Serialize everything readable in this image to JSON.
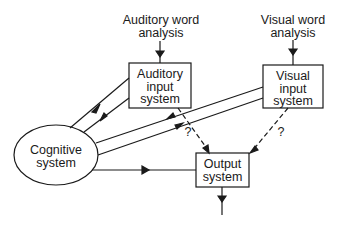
{
  "diagram": {
    "sources": {
      "auditory": {
        "line1": "Auditory word",
        "line2": "analysis"
      },
      "visual": {
        "line1": "Visual word",
        "line2": "analysis"
      }
    },
    "nodes": {
      "auditory_input": {
        "line1": "Auditory",
        "line2": "input",
        "line3": "system"
      },
      "visual_input": {
        "line1": "Visual",
        "line2": "input",
        "line3": "system"
      },
      "cognitive": {
        "line1": "Cognitive",
        "line2": "system"
      },
      "output": {
        "line1": "Output",
        "line2": "system"
      }
    },
    "annotations": {
      "q1": "?",
      "q2": "?"
    },
    "edges": [
      {
        "from": "Auditory word analysis",
        "to": "Auditory input system",
        "style": "solid"
      },
      {
        "from": "Visual word analysis",
        "to": "Visual input system",
        "style": "solid"
      },
      {
        "from": "Cognitive system",
        "to": "Auditory input system",
        "style": "solid"
      },
      {
        "from": "Auditory input system",
        "to": "Cognitive system",
        "style": "solid"
      },
      {
        "from": "Visual input system",
        "to": "Cognitive system",
        "style": "solid"
      },
      {
        "from": "Cognitive system",
        "to": "Visual input system",
        "style": "solid"
      },
      {
        "from": "Cognitive system",
        "to": "Output system",
        "style": "solid"
      },
      {
        "from": "Auditory input system",
        "to": "Output system",
        "style": "dashed",
        "label": "?"
      },
      {
        "from": "Visual input system",
        "to": "Output system",
        "style": "dashed",
        "label": "?"
      },
      {
        "from": "Output system",
        "to": "(output)",
        "style": "solid"
      }
    ]
  }
}
